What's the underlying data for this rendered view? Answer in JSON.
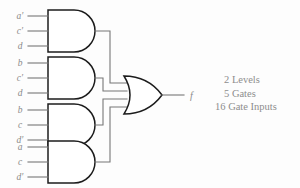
{
  "diagram": {
    "output_label": "f",
    "colors": {
      "background": "#fdfdfd",
      "wire": "#777777",
      "gate_outline": "#1c1c1c",
      "gate_fill": "#ffffff",
      "label_text": "#8a8a8a",
      "stats_text": "#8d8d8d"
    },
    "and_gates": [
      {
        "name": "and-gate-1",
        "type": "AND",
        "inputs": [
          "a′",
          "c′",
          "d"
        ]
      },
      {
        "name": "and-gate-2",
        "type": "AND",
        "inputs": [
          "b",
          "c′",
          "d"
        ]
      },
      {
        "name": "and-gate-3",
        "type": "AND",
        "inputs": [
          "b",
          "c",
          "d′"
        ]
      },
      {
        "name": "and-gate-4",
        "type": "AND",
        "inputs": [
          "a",
          "c",
          "d′"
        ]
      }
    ],
    "or_gate": {
      "name": "or-gate",
      "type": "OR",
      "input_count": 4
    }
  },
  "stats": {
    "levels": "2 Levels",
    "gates": "5 Gates",
    "gate_inputs": "16 Gate Inputs"
  }
}
